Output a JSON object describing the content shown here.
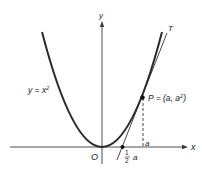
{
  "diagram": {
    "curve_label": "y = x",
    "curve_label_exp": "2",
    "axis_x_label": "x",
    "axis_y_label": "y",
    "origin_label": "O",
    "point_label": "P = (a, a",
    "point_label_exp": "2",
    "point_label_close": ")",
    "tangent_label": "T",
    "a_label": "a",
    "half_num": "1",
    "half_den": "2",
    "half_var": "a",
    "colors": {
      "curve": "#2a2a2a",
      "axis": "#3a3a3a",
      "tangent": "#333333",
      "point": "#111111",
      "background": "#ffffff"
    }
  }
}
